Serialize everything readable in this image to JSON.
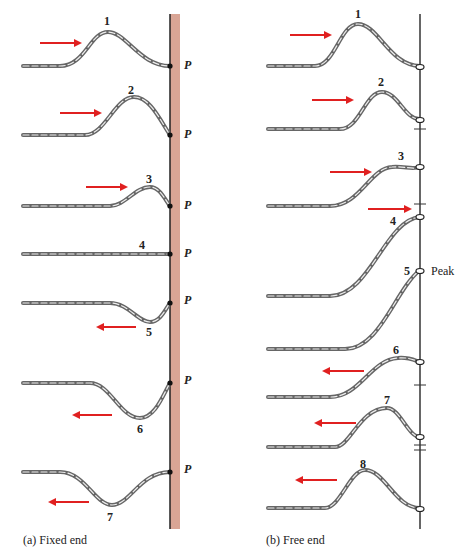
{
  "diagram": {
    "panel_a": {
      "caption": "(a)  Fixed end",
      "end_label": "P",
      "wall_color": "#d9a595",
      "pulses": [
        {
          "n": "1"
        },
        {
          "n": "2"
        },
        {
          "n": "3"
        },
        {
          "n": "4"
        },
        {
          "n": "5"
        },
        {
          "n": "6"
        },
        {
          "n": "7"
        }
      ]
    },
    "panel_b": {
      "caption": "(b)  Free end",
      "peak_label": "Peak",
      "pulses": [
        {
          "n": "1"
        },
        {
          "n": "2"
        },
        {
          "n": "3"
        },
        {
          "n": "4"
        },
        {
          "n": "5"
        },
        {
          "n": "6"
        },
        {
          "n": "7"
        },
        {
          "n": "8"
        }
      ]
    },
    "arrow_color": "#e02020",
    "rope_color": "#777777"
  }
}
